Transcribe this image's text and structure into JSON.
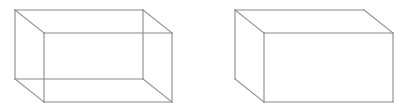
{
  "canvas": {
    "width": 397,
    "height": 109,
    "background": "#ffffff"
  },
  "style": {
    "stroke": "#8a8a8a",
    "stroke_width": 1.1
  },
  "figures": [
    {
      "name": "wireframe-box",
      "description": "Transparent rectangular prism with all 12 edges visible",
      "back_face": {
        "x": 15,
        "y": 10,
        "w": 128,
        "h": 69
      },
      "front_face": {
        "x": 44,
        "y": 33,
        "w": 128,
        "h": 69
      },
      "show_hidden_edges": true
    },
    {
      "name": "solid-box",
      "description": "Opaque rectangular prism with hidden edges removed",
      "back_face": {
        "x": 235,
        "y": 10,
        "w": 129,
        "h": 69
      },
      "front_face": {
        "x": 264,
        "y": 33,
        "w": 129,
        "h": 69
      },
      "show_hidden_edges": false
    }
  ]
}
